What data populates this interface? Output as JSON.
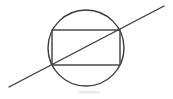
{
  "figure": {
    "background_color": "#ffffff",
    "stroke_color": "#3a3a3a",
    "canvas": {
      "width": 173,
      "height": 99
    }
  },
  "shapes": {
    "circle": {
      "name": "circle",
      "center_x": 86,
      "center_y": 48,
      "radius": 38,
      "stroke_width": 1.4,
      "color": "#3a3a3a"
    },
    "rectangle": {
      "name": "inscribed-rectangle",
      "x": 52,
      "y": 30,
      "width": 68,
      "height": 35,
      "stroke_width": 1.5,
      "color": "#4a4a4a",
      "corners": [
        {
          "label": "top-left",
          "x": 52,
          "y": 30
        },
        {
          "label": "top-right",
          "x": 120,
          "y": 30
        },
        {
          "label": "bottom-right",
          "x": 120,
          "y": 65
        },
        {
          "label": "bottom-left",
          "x": 52,
          "y": 65
        }
      ]
    },
    "diagonal_line": {
      "name": "extended-diagonal",
      "x1": 9,
      "y1": 87,
      "x2": 164,
      "y2": 6,
      "stroke_width": 1.4,
      "color": "#3a3a3a",
      "passes_through": [
        "rectangle bottom-left corner",
        "rectangle top-right corner"
      ]
    },
    "smudge": {
      "name": "scan-artifact-smudge",
      "x": 78,
      "y": 91,
      "width": 22,
      "height": 2.5,
      "color": "#d8d8d8"
    }
  },
  "chart_data": {
    "type": "diagram",
    "elements": [
      {
        "kind": "circle",
        "center": [
          86,
          48
        ],
        "radius": 38,
        "bounds": {
          "left": 48,
          "right": 124,
          "top": 10,
          "bottom": 86
        }
      },
      {
        "kind": "rectangle",
        "top_left": [
          52,
          30
        ],
        "bottom_right": [
          120,
          65
        ],
        "width": 68,
        "height": 35,
        "inscribed_in": "circle"
      },
      {
        "kind": "line",
        "from": [
          9,
          87
        ],
        "to": [
          164,
          6
        ],
        "description": "diagonal of rectangle extended beyond the circle on both ends"
      }
    ],
    "xlabel": "",
    "ylabel": "",
    "grid": false,
    "legend": "none"
  }
}
